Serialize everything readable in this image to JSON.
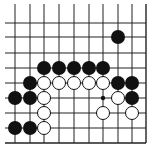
{
  "board": {
    "description": "Go board corner diagram (bottom-right corner, open on top and left)",
    "colors": {
      "background": "#ffffff",
      "line": "#222222",
      "black_stone": "#111111",
      "white_stone_fill": "#ffffff",
      "white_stone_stroke": "#111111"
    },
    "columns_x": [
      15,
      30,
      44,
      59,
      74,
      89,
      103,
      118,
      132,
      146
    ],
    "rows_y": [
      23,
      37,
      53,
      68,
      83,
      98,
      113,
      128,
      143
    ],
    "edges": {
      "right": true,
      "bottom": true,
      "top": false,
      "left": false
    },
    "stone_radius": 7,
    "stones": [
      {
        "color": "black",
        "col": 7,
        "row": 1
      },
      {
        "color": "black",
        "col": 2,
        "row": 3
      },
      {
        "color": "black",
        "col": 3,
        "row": 3
      },
      {
        "color": "black",
        "col": 4,
        "row": 3
      },
      {
        "color": "black",
        "col": 5,
        "row": 3
      },
      {
        "color": "black",
        "col": 6,
        "row": 3
      },
      {
        "color": "black",
        "col": 1,
        "row": 4
      },
      {
        "color": "white",
        "col": 2,
        "row": 4
      },
      {
        "color": "white",
        "col": 3,
        "row": 4
      },
      {
        "color": "white",
        "col": 4,
        "row": 4
      },
      {
        "color": "white",
        "col": 5,
        "row": 4
      },
      {
        "color": "white",
        "col": 6,
        "row": 4
      },
      {
        "color": "black",
        "col": 7,
        "row": 4
      },
      {
        "color": "black",
        "col": 8,
        "row": 4
      },
      {
        "color": "black",
        "col": 0,
        "row": 5
      },
      {
        "color": "black",
        "col": 1,
        "row": 5
      },
      {
        "color": "white",
        "col": 2,
        "row": 5
      },
      {
        "color": "white",
        "col": 7,
        "row": 5
      },
      {
        "color": "black",
        "col": 8,
        "row": 5
      },
      {
        "color": "white",
        "col": 2,
        "row": 6
      },
      {
        "color": "white",
        "col": 6,
        "row": 6
      },
      {
        "color": "white",
        "col": 8,
        "row": 6
      },
      {
        "color": "black",
        "col": 0,
        "row": 7
      },
      {
        "color": "black",
        "col": 1,
        "row": 7
      },
      {
        "color": "white",
        "col": 2,
        "row": 7
      }
    ],
    "markers": [
      {
        "type": "dot",
        "col": 6,
        "row": 5
      }
    ]
  }
}
